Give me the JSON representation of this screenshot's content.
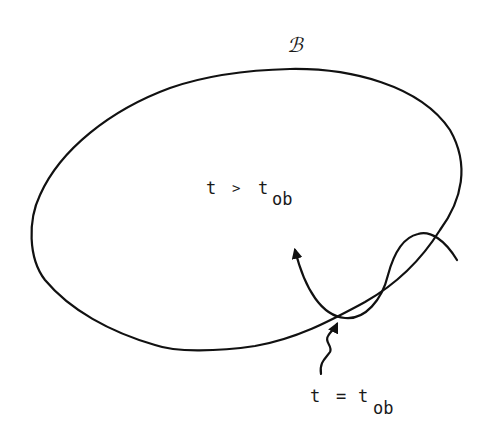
{
  "diagram": {
    "region_label": "ℬ",
    "inside_label": {
      "lhs": "t",
      "relation": ">",
      "rhs_base": "t",
      "rhs_subscript": "ob"
    },
    "boundary_label": {
      "lhs": "t",
      "relation": "=",
      "rhs_base": "t",
      "rhs_subscript": "ob"
    },
    "elements": {
      "region": "closed-region-boundary",
      "trajectory": "trajectory-curve-with-arrow",
      "pointer": "squiggle-pointer-arrow"
    },
    "colors": {
      "ink": "#111111",
      "background": "#ffffff"
    }
  }
}
